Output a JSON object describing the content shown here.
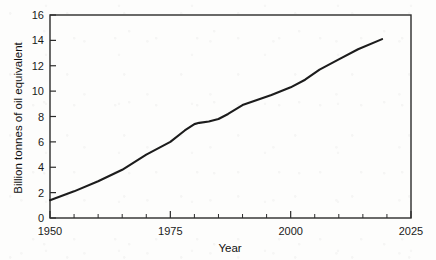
{
  "chart_data": {
    "type": "line",
    "title": "",
    "subtitle": "",
    "xlabel": "Year",
    "ylabel": "Billion tonnes of oil equivalent",
    "xlim": [
      1950,
      2025
    ],
    "ylim": [
      0,
      16
    ],
    "x_major_ticks": [
      1950,
      1975,
      2000,
      2025
    ],
    "x_minor_tick_step": 5,
    "y_major_ticks": [
      0,
      2,
      4,
      6,
      8,
      10,
      12,
      14,
      16
    ],
    "x_tick_labels": [
      "1950",
      "1975",
      "2000",
      "2025"
    ],
    "y_tick_labels": [
      "0",
      "2",
      "4",
      "6",
      "8",
      "10",
      "12",
      "14",
      "16"
    ],
    "grid": false,
    "legend": null,
    "legend_position": "none",
    "annotations": [],
    "series": [
      {
        "name": "Global primary energy consumption",
        "color": "#1c1c1c",
        "x": [
          1950,
          1955,
          1960,
          1965,
          1970,
          1975,
          1978,
          1980,
          1981,
          1983,
          1985,
          1987,
          1990,
          1993,
          1996,
          2000,
          2003,
          2006,
          2010,
          2014,
          2019
        ],
        "y": [
          1.4,
          2.1,
          2.9,
          3.8,
          5.0,
          6.0,
          6.9,
          7.4,
          7.5,
          7.6,
          7.8,
          8.2,
          8.9,
          9.3,
          9.7,
          10.3,
          10.9,
          11.7,
          12.5,
          13.3,
          14.1
        ]
      }
    ]
  },
  "chart_geometry": {
    "plot_left": 50,
    "plot_right": 411,
    "plot_top": 15,
    "plot_bottom": 218
  }
}
